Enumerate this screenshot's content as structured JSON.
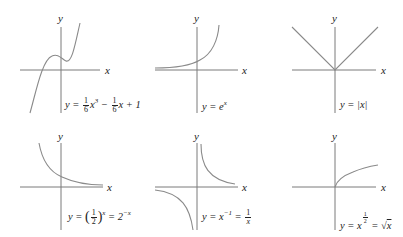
{
  "figure": {
    "axis_labels": {
      "x": "x",
      "y": "y"
    },
    "colors": {
      "axis": "#7a7a7a",
      "curve": "#8a8a8a",
      "text": "#222222"
    },
    "panels": [
      {
        "id": "cubic",
        "eq_prefix": "y = ",
        "frac1_num": "1",
        "frac1_den": "6",
        "term1": "x",
        "exp1": "3",
        "op1": " − ",
        "frac2_num": "1",
        "frac2_den": "6",
        "term2": "x + 1"
      },
      {
        "id": "exp",
        "eq_text": "y = e",
        "exp": "x"
      },
      {
        "id": "abs",
        "eq_text": "y = |x|"
      },
      {
        "id": "half-pow",
        "eq_prefix": "y = ",
        "frac_num": "1",
        "frac_den": "2",
        "exp": "x",
        "eq_suffix": " = 2",
        "suffix_exp": "−x"
      },
      {
        "id": "reciprocal",
        "eq_prefix": "y = x",
        "exp": "−1",
        "eq_mid": " = ",
        "frac_num": "1",
        "frac_den": "x"
      },
      {
        "id": "sqrt",
        "eq_prefix": "y = x",
        "frac_num": "1",
        "frac_den": "2",
        "eq_mid": " = √",
        "radicand": "x"
      }
    ]
  }
}
